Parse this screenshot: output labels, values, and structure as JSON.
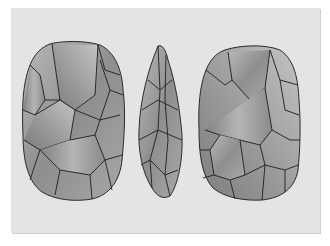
{
  "figure": {
    "background_color": "#e4e4e4",
    "stone_color": "#9a9a9a",
    "outline_color": "#2a2a2a",
    "views": [
      {
        "name": "front-view",
        "label": "Front face"
      },
      {
        "name": "side-view",
        "label": "Side profile"
      },
      {
        "name": "back-view",
        "label": "Back face"
      }
    ]
  }
}
